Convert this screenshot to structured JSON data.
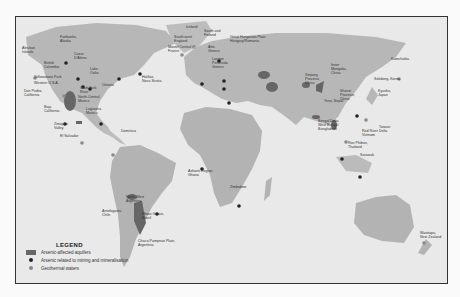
{
  "map": {
    "legend": {
      "title": "LEGEND",
      "items": [
        {
          "label": "Arsenic-affected aquifers",
          "symbol": "rect",
          "color": "#666666"
        },
        {
          "label": "Arsenic related to mining and mineralisation",
          "symbol": "dot",
          "color": "#222222"
        },
        {
          "label": "Geothermal waters",
          "symbol": "dot",
          "color": "#888888"
        }
      ]
    },
    "labels": {
      "fairbanks": "Fairbanks,\nAlaska",
      "aleutian": "Aleutian\nIslands",
      "coeur": "Coeur\nD'Alene",
      "british_columbia": "British\nColumbia",
      "lake_oahe": "Lake\nOahe",
      "yellowstone": "Yellowstone Park",
      "western_usa": "Western U.S.A.",
      "ontario": "Ontario",
      "clark_fork": "Clark Fork\nRiver",
      "halifax": "Halifax,\nNova Scotia",
      "don_pedro": "Don Pedro,\nCalifornia",
      "north_central_mexico": "North-Central\nMexico",
      "baja": "Baja\nCalifornia",
      "lagunera": "Lagunera\nMexico",
      "zimapan": "Zimapan\nValley",
      "el_salvador": "El Salvador",
      "dominica": "Dominica",
      "iceland": "Iceland",
      "sw_england": "South-west\nEngland",
      "massif_central": "Massif Central (f)\nFrance",
      "sw_finland": "South and\nFinland",
      "great_hungarian": "Great Hungarian Plain\nHungary/Romania",
      "attic": "Attic\nGreece",
      "lavrion": "Lavrion\nPeninsula\nGreece",
      "ashanti": "Ashanti Region,\nGhana",
      "zimbabwe": "Zimbabwe",
      "north_west_argentina": "North-West\nArgentina",
      "antofagasta": "Antofagasta\nChile",
      "minas_gerais": "Minas Gerais,\nBrazil",
      "chaco_pampean": "Chaco-Pampean Plain,\nArgentina",
      "inner_mongolia": "Inner\nMongolia,\nChina",
      "xinjiang": "Xinjiang\nProvince,\nChina",
      "shanxi": "Shanxi\nProvince,\nChina",
      "kamchatka": "Kamchatka",
      "sokdong": "Sokdong, Korea",
      "kyushu": "Kyushu,\nJapan",
      "terai_nepal": "Terai, Nepal",
      "bengal_delta": "Bengal Delta\nWest Bengal\nBangladesh",
      "taiwan": "Taiwan",
      "red_river": "Red River Delta\nVietnam",
      "ron_phibun": "Ron Phibun,\nThailand",
      "sarawak": "Sarawak",
      "waiotapu": "Waiotapu,\nNew Zealand"
    }
  }
}
